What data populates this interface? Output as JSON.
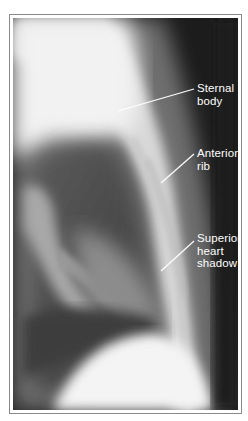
{
  "figure": {
    "type": "lateral chest radiograph",
    "labels": [
      {
        "id": "sternal-body",
        "lines": [
          "Sternal",
          "body"
        ]
      },
      {
        "id": "anterior-rib",
        "lines": [
          "Anterior",
          "rib"
        ]
      },
      {
        "id": "superior-heart-shadow",
        "lines": [
          "Superior",
          "heart",
          "shadow"
        ]
      }
    ],
    "colors": {
      "label_text": "#ffffff",
      "leader_line": "#ffffff",
      "frame_border": "#8a8a8a",
      "background_dark": "#1b1b1b"
    }
  }
}
